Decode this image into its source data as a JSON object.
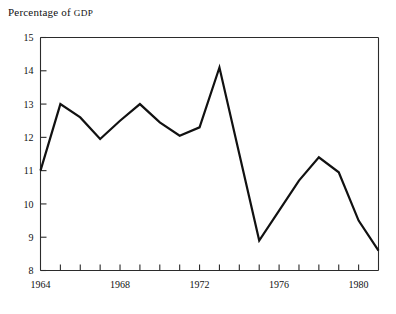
{
  "chart_data": {
    "type": "line",
    "title": "Percentage of GDP",
    "title_main": "Percentage of ",
    "title_smallcaps": "GDP",
    "xlabel": "",
    "ylabel": "",
    "x": [
      1964,
      1965,
      1966,
      1967,
      1968,
      1969,
      1970,
      1971,
      1972,
      1973,
      1974,
      1975,
      1976,
      1977,
      1978,
      1979,
      1980,
      1981
    ],
    "values": [
      11.0,
      13.0,
      12.6,
      11.95,
      12.5,
      13.0,
      12.45,
      12.05,
      12.3,
      14.1,
      11.5,
      8.9,
      9.8,
      10.7,
      11.4,
      10.95,
      9.5,
      8.6
    ],
    "series": [
      {
        "name": "Percentage of GDP",
        "values": [
          11.0,
          13.0,
          12.6,
          11.95,
          12.5,
          13.0,
          12.45,
          12.05,
          12.3,
          14.1,
          11.5,
          8.9,
          9.8,
          10.7,
          11.4,
          10.95,
          9.5,
          8.6
        ]
      }
    ],
    "ylim": [
      8,
      15
    ],
    "xlim": [
      1964,
      1981
    ],
    "y_ticks": [
      8,
      9,
      10,
      11,
      12,
      13,
      14,
      15
    ],
    "y_tick_labels": [
      "8",
      "9",
      "10",
      "11",
      "12",
      "13",
      "14",
      "15"
    ],
    "x_ticks": [
      1964,
      1965,
      1966,
      1967,
      1968,
      1969,
      1970,
      1971,
      1972,
      1973,
      1974,
      1975,
      1976,
      1977,
      1978,
      1979,
      1980,
      1981
    ],
    "x_tick_labels": [
      {
        "year": 1964,
        "label": "1964"
      },
      {
        "year": 1968,
        "label": "1968"
      },
      {
        "year": 1972,
        "label": "1972"
      },
      {
        "year": 1976,
        "label": "1976"
      },
      {
        "year": 1980,
        "label": "1980"
      }
    ],
    "grid": false,
    "legend": false,
    "legend_position": "none",
    "line_color": "#111111",
    "line_width": 2.2,
    "axis_color": "#2b2b2b",
    "background": "#ffffff",
    "frame": [
      "top",
      "left",
      "bottom"
    ],
    "annotations": []
  }
}
